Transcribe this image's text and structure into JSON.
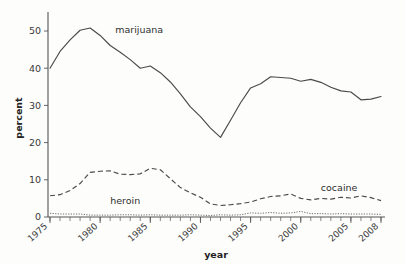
{
  "chart_data": {
    "type": "line",
    "title": "",
    "xlabel": "year",
    "ylabel": "percent",
    "xlim": [
      1975,
      2008
    ],
    "ylim": [
      0,
      54
    ],
    "grid": false,
    "legend_position": "inline-annotations",
    "y_ticks": [
      0,
      10,
      20,
      30,
      40,
      50
    ],
    "y_tick_labels": [
      "0",
      "10",
      "20",
      "30",
      "40",
      "50"
    ],
    "x_ticks": [
      1975,
      1980,
      1985,
      1990,
      1995,
      2000,
      2005,
      2008
    ],
    "x_tick_labels": [
      "1975",
      "1980",
      "1985",
      "1990",
      "1995",
      "2000",
      "2005",
      "2008"
    ],
    "x_minor_tick_step": 1,
    "x": [
      1975,
      1976,
      1977,
      1978,
      1979,
      1980,
      1981,
      1982,
      1983,
      1984,
      1985,
      1986,
      1987,
      1988,
      1989,
      1990,
      1991,
      1992,
      1993,
      1994,
      1995,
      1996,
      1997,
      1998,
      1999,
      2000,
      2001,
      2002,
      2003,
      2004,
      2005,
      2006,
      2007,
      2008
    ],
    "series": [
      {
        "name": "marijuana",
        "style": "solid",
        "label_x": 1981.5,
        "label_y": 49.5,
        "values": [
          40.0,
          44.5,
          47.6,
          50.2,
          50.8,
          48.8,
          46.1,
          44.3,
          42.3,
          40.0,
          40.6,
          38.8,
          36.3,
          33.1,
          29.6,
          27.0,
          23.9,
          21.4,
          26.0,
          30.7,
          34.7,
          35.8,
          37.7,
          37.5,
          37.3,
          36.5,
          37.0,
          36.2,
          34.9,
          33.9,
          33.6,
          31.5,
          31.7,
          32.4
        ]
      },
      {
        "name": "cocaine",
        "style": "dashed",
        "label_x": 2002.0,
        "label_y": 7.0,
        "values": [
          5.7,
          6.0,
          7.1,
          9.0,
          12.0,
          12.3,
          12.4,
          11.5,
          11.4,
          11.6,
          13.1,
          12.7,
          10.3,
          7.9,
          6.5,
          5.3,
          3.5,
          3.1,
          3.3,
          3.6,
          4.0,
          4.9,
          5.5,
          5.7,
          6.2,
          5.0,
          4.6,
          5.0,
          4.8,
          5.3,
          5.1,
          5.7,
          5.2,
          4.4
        ]
      },
      {
        "name": "heroin",
        "style": "dotted",
        "label_x": 1981.0,
        "label_y": 3.4,
        "values": [
          1.0,
          0.8,
          0.8,
          0.8,
          0.5,
          0.5,
          0.5,
          0.6,
          0.6,
          0.5,
          0.6,
          0.5,
          0.5,
          0.5,
          0.6,
          0.5,
          0.4,
          0.6,
          0.5,
          0.6,
          1.1,
          1.0,
          1.2,
          1.0,
          1.1,
          1.5,
          0.9,
          0.9,
          0.8,
          0.9,
          0.8,
          0.8,
          0.8,
          0.7
        ]
      }
    ]
  },
  "labels": {
    "ylabel": "percent",
    "xlabel": "year",
    "marijuana": "marijuana",
    "cocaine": "cocaine",
    "heroin": "heroin"
  },
  "colors": {
    "axis": "#555555",
    "line": "#4a4a4a",
    "text": "#2e2e2e",
    "background": "#fdfdfc"
  }
}
